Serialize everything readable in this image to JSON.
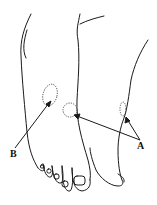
{
  "figure": {
    "labels": {
      "a": "A",
      "b": "B"
    },
    "colors": {
      "line": "#1a1a1a",
      "background": "#ffffff"
    }
  }
}
